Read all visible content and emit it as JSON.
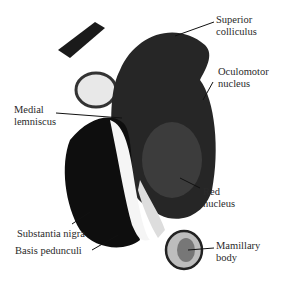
{
  "figure": {
    "labels": [
      {
        "id": "superior-colliculus",
        "text": "Superior\ncolliculus",
        "x": 216,
        "y": 14
      },
      {
        "id": "oculomotor-nucleus",
        "text": "Oculomotor\nnucleus",
        "x": 218,
        "y": 66
      },
      {
        "id": "medial-lemniscus",
        "text": "Medial\nlemniscus",
        "x": 14,
        "y": 104
      },
      {
        "id": "red-nucleus",
        "text": "Red\nnucleus",
        "x": 203,
        "y": 186
      },
      {
        "id": "substantia-nigra",
        "text": "Substantia nigra",
        "x": 17,
        "y": 228
      },
      {
        "id": "basis-pedunculi",
        "text": "Basis pedunculi",
        "x": 15,
        "y": 245
      },
      {
        "id": "mamillary-body",
        "text": "Mamillary\nbody",
        "x": 216,
        "y": 240
      }
    ]
  }
}
